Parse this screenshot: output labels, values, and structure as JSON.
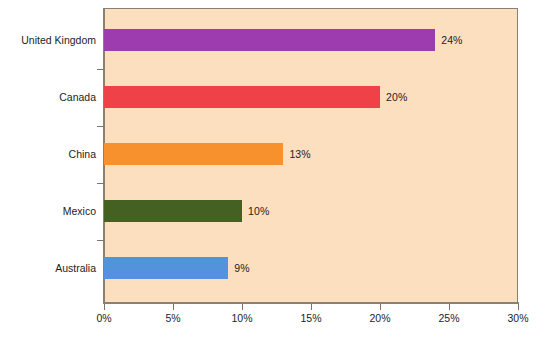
{
  "chart_data": {
    "type": "bar",
    "orientation": "horizontal",
    "title": "",
    "subtitle": "",
    "xlabel": "",
    "ylabel": "",
    "categories": [
      "United Kingdom",
      "Canada",
      "China",
      "Mexico",
      "Australia"
    ],
    "values": [
      24,
      20,
      13,
      10,
      9
    ],
    "value_labels": [
      "24%",
      "20%",
      "13%",
      "10%",
      "9%"
    ],
    "bar_colors": [
      "#9c3caf",
      "#ee4248",
      "#f6912e",
      "#456122",
      "#5393de"
    ],
    "xlim": [
      0,
      30
    ],
    "xtick_values": [
      0,
      5,
      10,
      15,
      20,
      25,
      30
    ],
    "xtick_labels": [
      "0%",
      "5%",
      "10%",
      "15%",
      "20%",
      "25%",
      "30%"
    ],
    "grid": false,
    "legend": false,
    "legend_position": "none",
    "plot_background": "#fbdfbe",
    "page_background": "#ffffff",
    "axis_color": "#8a8074"
  }
}
